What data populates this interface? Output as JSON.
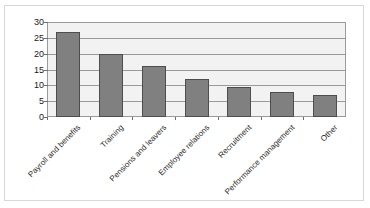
{
  "chart_data": {
    "type": "bar",
    "title": "",
    "subtitle": "",
    "xlabel": "",
    "ylabel": "",
    "categories": [
      "Payroll and benefits",
      "Training",
      "Pensions and leavers",
      "Employee relations",
      "Recruitment",
      "Performance management",
      "Other"
    ],
    "values": [
      27,
      20,
      16,
      12,
      9.5,
      8,
      7
    ],
    "ylim": [
      0,
      30
    ],
    "y_ticks": [
      0,
      5,
      10,
      15,
      20,
      25,
      30
    ],
    "y_tick_labels": [
      "0",
      "5",
      "10",
      "15",
      "20",
      "25",
      "30"
    ],
    "grid": "horizontal",
    "legend": "none",
    "bar_color": "#808080",
    "bar_edge_color": "#4d4d4d",
    "plot_background": "#f2f2f2",
    "gridline_color": "#9a9a9a",
    "axis_color": "#6e6e6e"
  }
}
